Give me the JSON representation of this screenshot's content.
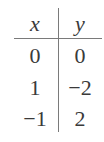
{
  "table": {
    "headers": [
      "x",
      "y"
    ],
    "rows": [
      [
        "0",
        "0"
      ],
      [
        "1",
        "−2"
      ],
      [
        "−1",
        "2"
      ]
    ]
  }
}
